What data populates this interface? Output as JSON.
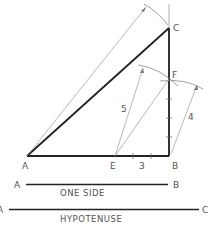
{
  "diagram": {
    "points": {
      "A": "A",
      "B": "B",
      "C": "C",
      "E": "E",
      "F": "F"
    },
    "dimensions": {
      "ef": "5",
      "fb": "4",
      "eb": "3"
    },
    "legend": {
      "one_side": {
        "start": "A",
        "end": "B",
        "caption": "ONE SIDE"
      },
      "hypotenuse": {
        "start": "A",
        "end": "C",
        "caption": "HYPOTENUSE"
      }
    },
    "colors": {
      "heavy_line": "#222222",
      "thin_line": "#888888",
      "text": "#555555"
    }
  }
}
